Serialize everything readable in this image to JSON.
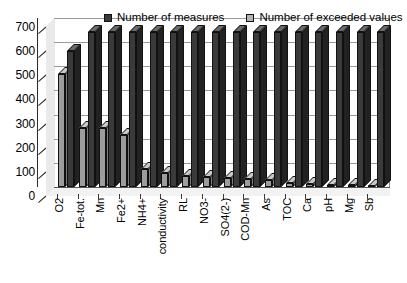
{
  "chart_data": {
    "type": "bar",
    "title": "",
    "subtitle": "",
    "xlabel": "",
    "ylabel": "",
    "ylim": [
      0,
      700
    ],
    "ytick_step": 100,
    "yticks": [
      0,
      100,
      200,
      300,
      400,
      500,
      600,
      700
    ],
    "ytick_labels": [
      "0",
      "100",
      "200",
      "300",
      "400",
      "500",
      "600",
      "700"
    ],
    "grid": true,
    "grid_axis": "y",
    "legend_position": "top-center",
    "style": "3d-grouped-bar-grayscale",
    "categories": [
      "O2",
      "Fe-tot.",
      "Mn",
      "Fe2+",
      "NH4+",
      "conductivity",
      "RL",
      "NO3-",
      "SO4(2-)",
      "COD-Mn",
      "As",
      "TOC",
      "Ca",
      "pH",
      "Mg",
      "Sb"
    ],
    "series": [
      {
        "name": "Number of measures",
        "color": "#3a3a3a",
        "values": [
          565,
          643,
          643,
          643,
          643,
          643,
          643,
          643,
          643,
          643,
          643,
          643,
          643,
          643,
          643,
          643
        ]
      },
      {
        "name": "Number of exceeded values",
        "color": "#9d9d9d",
        "values": [
          470,
          245,
          245,
          215,
          75,
          60,
          45,
          42,
          38,
          33,
          28,
          18,
          14,
          10,
          8,
          6
        ]
      }
    ]
  },
  "legend": {
    "items": [
      {
        "label": "Number of measures",
        "swatch": "dark"
      },
      {
        "label": "Number of exceeded values",
        "swatch": "light"
      }
    ]
  }
}
